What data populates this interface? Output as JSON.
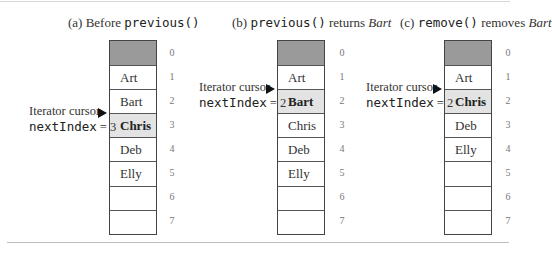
{
  "panels": [
    {
      "id": "a",
      "title": {
        "prefix": "(a) Before ",
        "code": "previous()",
        "suffix": "",
        "italic": ""
      },
      "cells": [
        "",
        "Art",
        "Bart",
        "Chris",
        "Deb",
        "Elly",
        "",
        ""
      ],
      "current_index": 3,
      "indices": [
        "0",
        "1",
        "2",
        "3",
        "4",
        "5",
        "6",
        "7"
      ],
      "cursor": {
        "label": "Iterator cursor",
        "next_index_code": "nextIndex",
        "next_index_eq": " = 3"
      }
    },
    {
      "id": "b",
      "title": {
        "prefix": "(b) ",
        "code": "previous()",
        "suffix": " returns ",
        "italic": "Bart"
      },
      "cells": [
        "",
        "Art",
        "Bart",
        "Chris",
        "Deb",
        "Elly",
        "",
        ""
      ],
      "current_index": 2,
      "indices": [
        "0",
        "1",
        "2",
        "3",
        "4",
        "5",
        "6",
        "7"
      ],
      "cursor": {
        "label": "Iterator cursor",
        "next_index_code": "nextIndex",
        "next_index_eq": " = 2"
      }
    },
    {
      "id": "c",
      "title": {
        "prefix": "(c) ",
        "code": "remove()",
        "suffix": " removes ",
        "italic": "Bart"
      },
      "cells": [
        "",
        "Art",
        "Chris",
        "Deb",
        "Elly",
        "",
        "",
        ""
      ],
      "current_index": 2,
      "indices": [
        "0",
        "1",
        "2",
        "3",
        "4",
        "5",
        "6",
        "7"
      ],
      "cursor": {
        "label": "Iterator cursor",
        "next_index_code": "nextIndex",
        "next_index_eq": " = 2"
      }
    }
  ],
  "colors": {
    "header_cell": "#9a9a9a",
    "current_cell": "#e3e3e3",
    "border": "#444444"
  }
}
